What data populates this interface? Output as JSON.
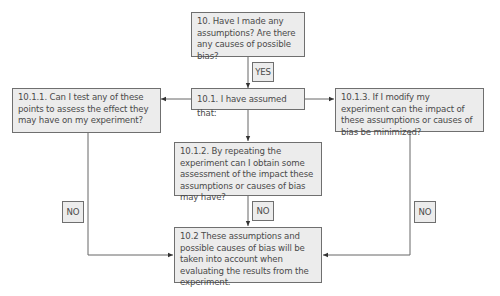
{
  "diagram": {
    "nodes": {
      "q10": {
        "id": "10",
        "text": "10. Have I made any assumptions? Are there any causes of possible bias?"
      },
      "n10_1": {
        "id": "10.1",
        "text": "10.1. I have assumed that:"
      },
      "n10_1_1": {
        "id": "10.1.1",
        "text": "10.1.1. Can I test any of these points to assess the effect they may have on my experiment?"
      },
      "n10_1_2": {
        "id": "10.1.2",
        "text": "10.1.2. By repeating the experiment can I obtain some assessment of the impact these assumptions or causes of bias may have?"
      },
      "n10_1_3": {
        "id": "10.1.3",
        "text": "10.1.3. If I modify my experiment can the impact of these assumptions or causes of bias be minimized?"
      },
      "n10_2": {
        "id": "10.2",
        "text": "10.2 These assumptions and possible causes of bias will be taken into account when evaluating the results from the experiment."
      }
    },
    "edge_labels": {
      "yes": "YES",
      "no_left": "NO",
      "no_center": "NO",
      "no_right": "NO"
    },
    "edges": [
      {
        "from": "10",
        "to": "10.1",
        "label": "YES"
      },
      {
        "from": "10.1",
        "to": "10.1.1"
      },
      {
        "from": "10.1",
        "to": "10.1.2"
      },
      {
        "from": "10.1",
        "to": "10.1.3"
      },
      {
        "from": "10.1.1",
        "to": "10.2",
        "label": "NO"
      },
      {
        "from": "10.1.2",
        "to": "10.2",
        "label": "NO"
      },
      {
        "from": "10.1.3",
        "to": "10.2",
        "label": "NO"
      }
    ],
    "colors": {
      "box_fill": "#ececec",
      "box_border": "#6f6f6f",
      "line": "#555555",
      "text": "#4a4a4a"
    }
  }
}
